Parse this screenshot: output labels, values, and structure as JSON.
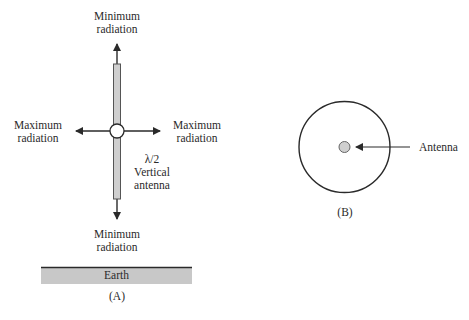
{
  "diagram_a": {
    "top_label": {
      "line1": "Minimum",
      "line2": "radiation"
    },
    "left_label": {
      "line1": "Maximum",
      "line2": "radiation"
    },
    "right_label": {
      "line1": "Maximum",
      "line2": "radiation"
    },
    "bottom_label": {
      "line1": "Minimum",
      "line2": "radiation"
    },
    "antenna_label": {
      "line1": "λ/2",
      "line2": "Vertical",
      "line3": "antenna"
    },
    "ground_label": "Earth",
    "caption": "(A)"
  },
  "diagram_b": {
    "antenna_label": "Antenna",
    "caption": "(B)"
  },
  "colors": {
    "line": "#2a2a2a",
    "antenna_fill": "#cfcfcf",
    "earth_fill": "#c8c8c8",
    "feed_fill": "#ffffff"
  }
}
